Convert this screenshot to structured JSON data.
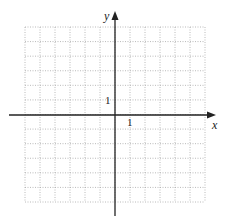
{
  "chart_data": {
    "type": "scatter",
    "title": "",
    "xlabel": "x",
    "ylabel": "y",
    "xlim": [
      -6,
      6
    ],
    "ylim": [
      -6,
      6
    ],
    "grid": true,
    "grid_style": "dotted",
    "tick_labels": [
      {
        "axis": "x",
        "value": 1,
        "label": "1"
      },
      {
        "axis": "y",
        "value": 1,
        "label": "1"
      }
    ],
    "series": [],
    "colors": {
      "axis": "#222222",
      "grid": "#a0a0a0",
      "background": "#ffffff"
    }
  },
  "axes": {
    "x_label": "x",
    "y_label": "y",
    "x_tick": "1",
    "y_tick": "1"
  }
}
